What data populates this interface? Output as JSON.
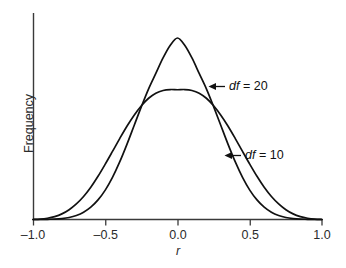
{
  "chart_data": {
    "type": "line",
    "title": "",
    "subtitle": "",
    "xlabel": "r",
    "ylabel": "Frequency",
    "xlim": [
      -1.0,
      1.0
    ],
    "ylim": [
      0,
      1.0
    ],
    "grid": false,
    "legend_position": "inline-annotations",
    "xticks": [
      -1.0,
      -0.5,
      0.0,
      0.5,
      1.0
    ],
    "xticklabels": [
      "–1.0",
      "–0.5",
      "0.0",
      "0.5",
      "1.0"
    ],
    "yticks": [],
    "yticklabels": [],
    "series": [
      {
        "name": "df = 20",
        "label_symbol": "df",
        "label_value": "= 20",
        "peak_x": 0.0,
        "peak_y": 1.0,
        "description": "narrow tall sampling distribution of r for df = 20",
        "x": [
          -1.0,
          -0.95,
          -0.9,
          -0.85,
          -0.8,
          -0.75,
          -0.7,
          -0.65,
          -0.6,
          -0.55,
          -0.5,
          -0.45,
          -0.4,
          -0.35,
          -0.3,
          -0.25,
          -0.2,
          -0.15,
          -0.1,
          -0.05,
          0.0,
          0.05,
          0.1,
          0.15,
          0.2,
          0.25,
          0.3,
          0.35,
          0.4,
          0.45,
          0.5,
          0.55,
          0.6,
          0.65,
          0.7,
          0.75,
          0.8,
          0.85,
          0.9,
          0.95,
          1.0
        ],
        "values": [
          0.0,
          0.0,
          0.001,
          0.002,
          0.005,
          0.011,
          0.022,
          0.04,
          0.068,
          0.108,
          0.162,
          0.232,
          0.317,
          0.414,
          0.518,
          0.622,
          0.72,
          0.805,
          0.89,
          0.96,
          1.0,
          0.96,
          0.89,
          0.805,
          0.72,
          0.622,
          0.518,
          0.414,
          0.317,
          0.232,
          0.162,
          0.108,
          0.068,
          0.04,
          0.022,
          0.011,
          0.005,
          0.002,
          0.001,
          0.0,
          0.0
        ]
      },
      {
        "name": "df = 10",
        "label_symbol": "df",
        "label_value": "= 10",
        "peak_x": 0.0,
        "peak_y": 0.715,
        "description": "wide flat sampling distribution of r for df = 10",
        "x": [
          -1.0,
          -0.95,
          -0.9,
          -0.85,
          -0.8,
          -0.75,
          -0.7,
          -0.65,
          -0.6,
          -0.55,
          -0.5,
          -0.45,
          -0.4,
          -0.35,
          -0.3,
          -0.25,
          -0.2,
          -0.15,
          -0.1,
          -0.05,
          0.0,
          0.05,
          0.1,
          0.15,
          0.2,
          0.25,
          0.3,
          0.35,
          0.4,
          0.45,
          0.5,
          0.55,
          0.6,
          0.65,
          0.7,
          0.75,
          0.8,
          0.85,
          0.9,
          0.95,
          1.0
        ],
        "values": [
          0.0,
          0.002,
          0.007,
          0.016,
          0.031,
          0.054,
          0.086,
          0.127,
          0.178,
          0.238,
          0.305,
          0.375,
          0.446,
          0.514,
          0.575,
          0.627,
          0.668,
          0.696,
          0.711,
          0.716,
          0.715,
          0.716,
          0.711,
          0.696,
          0.668,
          0.627,
          0.575,
          0.514,
          0.446,
          0.375,
          0.305,
          0.238,
          0.178,
          0.127,
          0.086,
          0.054,
          0.031,
          0.016,
          0.007,
          0.002,
          0.0
        ]
      }
    ],
    "annotations": [
      {
        "text": "df = 20",
        "arrow": "left-arrow",
        "points_to_series": "df = 20"
      },
      {
        "text": "df = 10",
        "arrow": "left-arrow",
        "points_to_series": "df = 10"
      }
    ],
    "colors": {
      "curve": "#111111",
      "axis": "#3a3a3a",
      "text": "#2b2b2b",
      "background": "#ffffff"
    }
  }
}
